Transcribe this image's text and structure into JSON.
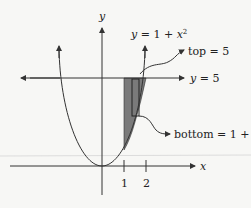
{
  "diagram": {
    "axis_x_label": "x",
    "axis_y_label": "y",
    "curve_label_y": "y",
    "curve_label_rest": " = 1 + ",
    "curve_label_x": "x",
    "curve_label_exp": "2",
    "line_label_y": "y",
    "line_label_rest": " = 5",
    "top_label": "top = 5",
    "bottom_label_text": "bottom = 1 + ",
    "bottom_label_x": "x",
    "bottom_label_exp": "2",
    "tick_1": "1",
    "tick_2": "2",
    "colors": {
      "stroke": "#333333",
      "shade": "#7a7a7a",
      "background": "#f7f7f5"
    }
  }
}
